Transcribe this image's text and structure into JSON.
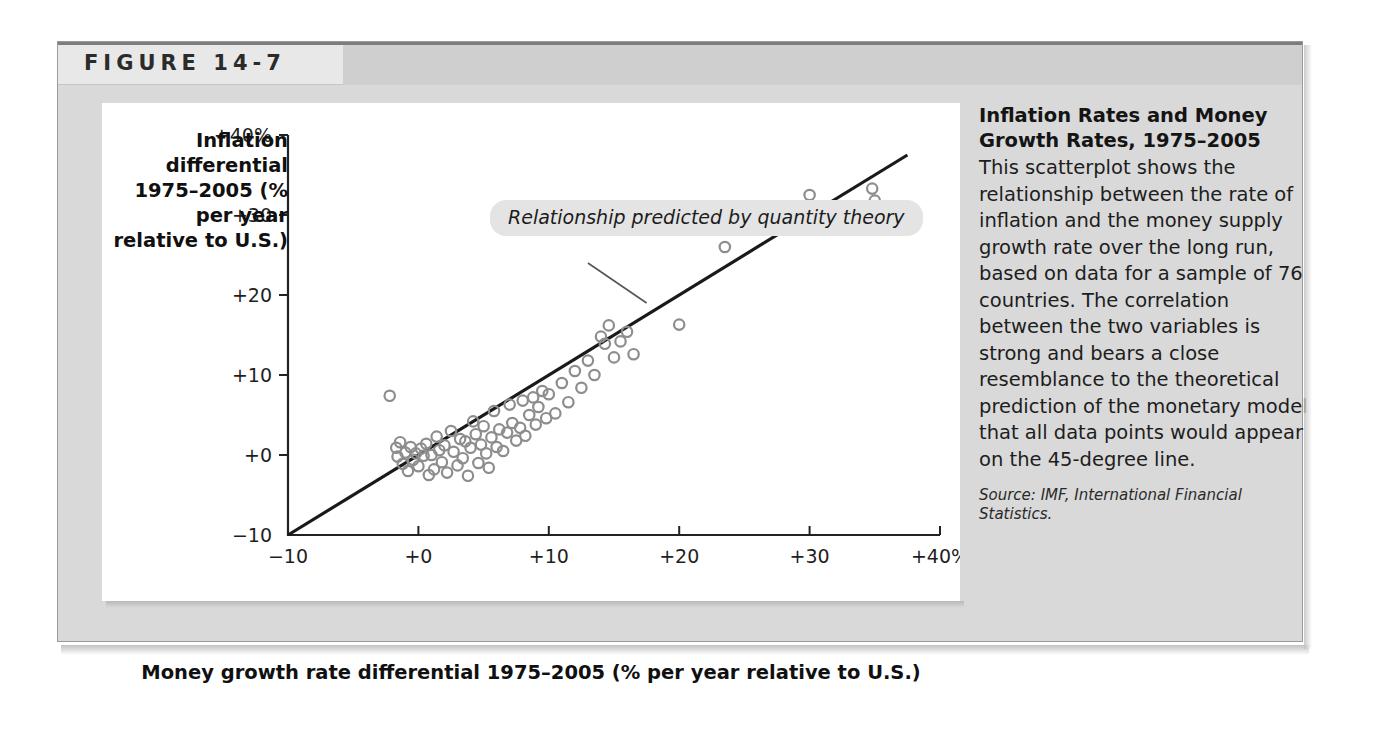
{
  "figure": {
    "label": "FIGURE 14-7"
  },
  "caption": {
    "title": "Inflation Rates and Money Growth Rates, 1975–2005",
    "body": "This scatterplot shows the relationship between the rate of inflation and the money supply growth rate over the long run, based on data for a sample of 76 countries. The correlation between the two variables is strong and bears a close resemblance to the theoretical prediction of the monetary model that all data points would appear on the 45-degree line.",
    "source": "Source: IMF, International Financial Statistics."
  },
  "colors": {
    "panel_background": "#ffffff",
    "figure_background": "#d9d9d9",
    "header_light": "#e8e8e8",
    "header_dark": "#cfcfcf",
    "point_stroke": "#8d8d8d",
    "line_stroke": "#1a1a1a",
    "axis_stroke": "#222222",
    "callout_background": "#e4e4e4"
  },
  "chart_data": {
    "type": "scatter",
    "title": "Inflation Rates and Money Growth Rates, 1975–2005",
    "xlabel": "Money growth rate differential 1975–2005 (% per year relative to U.S.)",
    "ylabel": "Inflation differential 1975–2005 (% per year relative to U.S.)",
    "xlim": [
      -10,
      40
    ],
    "ylim": [
      -10,
      40
    ],
    "grid": false,
    "legend": false,
    "x_ticks": [
      -10,
      0,
      10,
      20,
      30,
      40
    ],
    "x_tick_labels": [
      "−10",
      "+0",
      "+10",
      "+20",
      "+30",
      "+40%"
    ],
    "y_ticks": [
      -10,
      0,
      10,
      20,
      30,
      40
    ],
    "y_tick_labels": [
      "−10",
      "+0",
      "+10",
      "+20",
      "+30",
      "+40%"
    ],
    "annotations": [
      {
        "text": "Relationship predicted by quantity theory",
        "style": "italic",
        "points_to": [
          17.5,
          19.0
        ]
      }
    ],
    "reference_line": {
      "name": "45-degree line (quantity theory prediction)",
      "from": [
        -10,
        -10
      ],
      "to": [
        37.5,
        37.5
      ],
      "slope": 1,
      "intercept": 0
    },
    "n_points": 76,
    "series": [
      {
        "name": "Countries (inflation vs. money growth differential)",
        "marker": "open-circle",
        "color": "#8d8d8d",
        "points": [
          [
            -2.2,
            7.4
          ],
          [
            -1.7,
            0.9
          ],
          [
            -1.6,
            -0.2
          ],
          [
            -1.4,
            1.6
          ],
          [
            -1.2,
            -1.1
          ],
          [
            -1.0,
            0.3
          ],
          [
            -0.8,
            -2.0
          ],
          [
            -0.6,
            1.0
          ],
          [
            -0.4,
            -0.6
          ],
          [
            -0.2,
            0.2
          ],
          [
            0.0,
            -1.4
          ],
          [
            0.2,
            0.8
          ],
          [
            0.4,
            -0.1
          ],
          [
            0.6,
            1.4
          ],
          [
            0.8,
            -2.5
          ],
          [
            1.0,
            0.0
          ],
          [
            1.2,
            -1.8
          ],
          [
            1.4,
            2.3
          ],
          [
            1.6,
            0.6
          ],
          [
            1.8,
            -0.9
          ],
          [
            2.0,
            1.2
          ],
          [
            2.2,
            -2.2
          ],
          [
            2.5,
            3.0
          ],
          [
            2.7,
            0.4
          ],
          [
            3.0,
            -1.3
          ],
          [
            3.2,
            2.0
          ],
          [
            3.4,
            -0.4
          ],
          [
            3.6,
            1.7
          ],
          [
            3.8,
            -2.6
          ],
          [
            4.0,
            0.9
          ],
          [
            4.2,
            4.2
          ],
          [
            4.4,
            2.6
          ],
          [
            4.6,
            -1.0
          ],
          [
            4.8,
            1.3
          ],
          [
            5.0,
            3.6
          ],
          [
            5.2,
            0.2
          ],
          [
            5.4,
            -1.6
          ],
          [
            5.6,
            2.2
          ],
          [
            5.8,
            5.5
          ],
          [
            6.0,
            1.0
          ],
          [
            6.2,
            3.2
          ],
          [
            6.5,
            0.5
          ],
          [
            6.8,
            2.8
          ],
          [
            7.0,
            6.3
          ],
          [
            7.2,
            4.0
          ],
          [
            7.5,
            1.8
          ],
          [
            7.8,
            3.4
          ],
          [
            8.0,
            6.8
          ],
          [
            8.2,
            2.4
          ],
          [
            8.5,
            5.0
          ],
          [
            8.8,
            7.2
          ],
          [
            9.0,
            3.8
          ],
          [
            9.2,
            6.0
          ],
          [
            9.5,
            8.0
          ],
          [
            9.8,
            4.6
          ],
          [
            10.0,
            7.6
          ],
          [
            10.5,
            5.2
          ],
          [
            11.0,
            9.0
          ],
          [
            11.5,
            6.6
          ],
          [
            12.0,
            10.5
          ],
          [
            12.5,
            8.4
          ],
          [
            13.0,
            11.8
          ],
          [
            13.5,
            10.0
          ],
          [
            14.0,
            14.8
          ],
          [
            14.3,
            13.9
          ],
          [
            14.6,
            16.2
          ],
          [
            15.0,
            12.2
          ],
          [
            15.5,
            14.2
          ],
          [
            16.0,
            15.4
          ],
          [
            16.5,
            12.6
          ],
          [
            20.0,
            16.3
          ],
          [
            23.5,
            26.0
          ],
          [
            26.0,
            29.0
          ],
          [
            28.0,
            31.0
          ],
          [
            30.0,
            32.5
          ],
          [
            34.8,
            33.3
          ],
          [
            35.0,
            31.8
          ]
        ]
      }
    ]
  }
}
